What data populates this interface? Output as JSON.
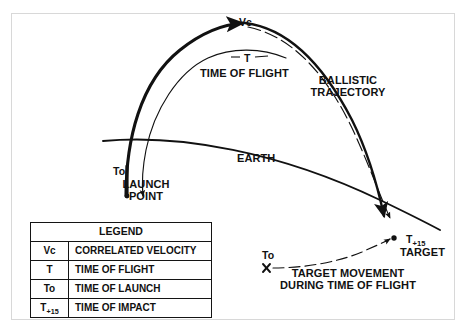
{
  "figure": {
    "background_color": "#ffffff",
    "ink_color": "#111111",
    "frame_color": "#d8d8d8"
  },
  "annotations": {
    "apex_symbol": "Vc",
    "flight_symbol": "T",
    "time_of_flight": "TIME OF FLIGHT",
    "ballistic_trajectory_line1": "BALLISTIC",
    "ballistic_trajectory_line2": "TRAJECTORY",
    "earth": "EARTH",
    "launch_time_symbol": "To",
    "launch_point_line1": "LAUNCH",
    "launch_point_line2": "POINT",
    "impact_symbol": "T+15",
    "target": "TARGET",
    "target_start_symbol": "To",
    "target_movement_line1": "TARGET MOVEMENT",
    "target_movement_line2": "DURING TIME OF FLIGHT"
  },
  "legend": {
    "title": "LEGEND",
    "rows": [
      {
        "symbol": "Vc",
        "description": "CORRELATED VELOCITY"
      },
      {
        "symbol": "T",
        "description": "TIME OF FLIGHT"
      },
      {
        "symbol": "To",
        "description": "TIME OF LAUNCH"
      },
      {
        "symbol": "T+15",
        "description": "TIME OF IMPACT"
      }
    ]
  }
}
